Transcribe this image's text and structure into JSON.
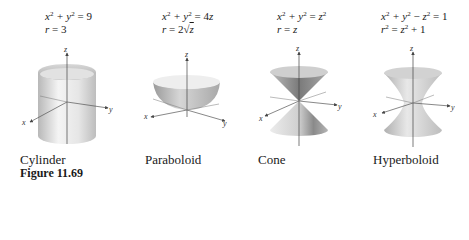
{
  "figure": {
    "label": "Figure 11.69",
    "surfaces": [
      {
        "name": "Cylinder",
        "cartesian": {
          "lhs": "x² + y²",
          "rhs": "9"
        },
        "cylindrical": {
          "lhs": "r",
          "rhs": "3"
        }
      },
      {
        "name": "Paraboloid",
        "cartesian": {
          "lhs": "x² + y²",
          "rhs": "4z"
        },
        "cylindrical": {
          "lhs": "r",
          "rhs": "2√z"
        }
      },
      {
        "name": "Cone",
        "cartesian": {
          "lhs": "x² + y²",
          "rhs": "z²"
        },
        "cylindrical": {
          "lhs": "r",
          "rhs": "z"
        }
      },
      {
        "name": "Hyperboloid",
        "cartesian": {
          "lhs": "x² + y² − z²",
          "rhs": "1"
        },
        "cylindrical": {
          "lhs": "r²",
          "rhs": "z² + 1"
        }
      }
    ],
    "axes": {
      "x": "x",
      "y": "y",
      "z": "z"
    }
  }
}
